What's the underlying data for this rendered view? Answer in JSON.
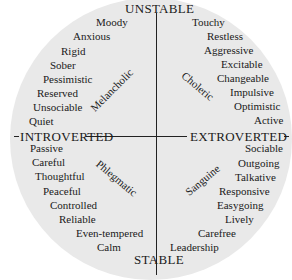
{
  "diagram": {
    "axes": {
      "top": "UNSTABLE",
      "bottom": "STABLE",
      "left": "INTROVERTED",
      "right": "EXTROVERTED"
    },
    "quadrants": {
      "melancholic": {
        "name": "Melancholic",
        "position": "top-left",
        "traits": [
          "Moody",
          "Anxious",
          "Rigid",
          "Sober",
          "Pessimistic",
          "Reserved",
          "Unsociable",
          "Quiet"
        ]
      },
      "choleric": {
        "name": "Choleric",
        "position": "top-right",
        "traits": [
          "Touchy",
          "Restless",
          "Aggressive",
          "Excitable",
          "Changeable",
          "Impulsive",
          "Optimistic",
          "Active"
        ]
      },
      "phlegmatic": {
        "name": "Phlegmatic",
        "position": "bottom-left",
        "traits": [
          "Passive",
          "Careful",
          "Thoughtful",
          "Peaceful",
          "Controlled",
          "Reliable",
          "Even-tempered",
          "Calm"
        ]
      },
      "sanguine": {
        "name": "Sanguine",
        "position": "bottom-right",
        "traits": [
          "Sociable",
          "Outgoing",
          "Talkative",
          "Responsive",
          "Easygoing",
          "Lively",
          "Carefree",
          "Leadership"
        ]
      }
    },
    "colors": {
      "circle_fill": "#e9e9e9",
      "text": "#1a1a1a",
      "lines": "#222222",
      "background": "#ffffff"
    }
  }
}
